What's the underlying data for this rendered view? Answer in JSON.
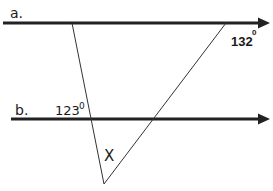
{
  "diagram": {
    "type": "parallel lines cut by transversals",
    "lines": [
      {
        "id": "a",
        "label": "a."
      },
      {
        "id": "b",
        "label": "b."
      }
    ],
    "angles": {
      "angle_132": {
        "value": "132",
        "degree_mark": "0"
      },
      "angle_123": {
        "value": "123",
        "degree_mark": "0"
      },
      "unknown": {
        "label": "X"
      }
    },
    "colors": {
      "line": "#222222",
      "background": "#ffffff"
    }
  }
}
